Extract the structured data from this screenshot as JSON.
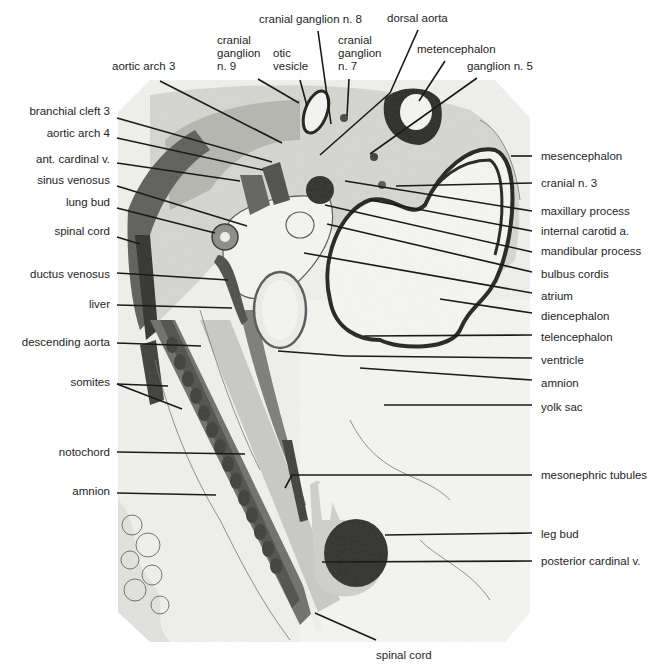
{
  "figure": {
    "type": "labeled micrograph",
    "colors": {
      "background": "#ffffff",
      "tissue_light": "#ececea",
      "tissue_mid": "#8a8a86",
      "tissue_dark": "#2a2a28",
      "leader_line": "#1a1a1a"
    }
  },
  "labels": {
    "top": [
      {
        "id": "aortic-arch-3",
        "text": "aortic arch 3"
      },
      {
        "id": "cranial-ganglion-9",
        "text": "cranial\nganglion\nn. 9"
      },
      {
        "id": "otic-vesicle",
        "text": "otic\nvesicle"
      },
      {
        "id": "cranial-ganglion-8",
        "text": "cranial ganglion n. 8"
      },
      {
        "id": "cranial-ganglion-7",
        "text": "cranial\nganglion\nn. 7"
      },
      {
        "id": "dorsal-aorta",
        "text": "dorsal aorta"
      },
      {
        "id": "metencephalon",
        "text": "metencephalon"
      },
      {
        "id": "ganglion-5",
        "text": "ganglion n. 5"
      }
    ],
    "left": [
      {
        "id": "branchial-cleft-3",
        "text": "branchial cleft 3"
      },
      {
        "id": "aortic-arch-4",
        "text": "aortic arch 4"
      },
      {
        "id": "ant-cardinal-v",
        "text": "ant. cardinal v."
      },
      {
        "id": "sinus-venosus",
        "text": "sinus venosus"
      },
      {
        "id": "lung-bud",
        "text": "lung bud"
      },
      {
        "id": "spinal-cord-upper",
        "text": "spinal cord"
      },
      {
        "id": "ductus-venosus",
        "text": "ductus venosus"
      },
      {
        "id": "liver",
        "text": "liver"
      },
      {
        "id": "descending-aorta",
        "text": "descending aorta"
      },
      {
        "id": "somites",
        "text": "somites"
      },
      {
        "id": "notochord",
        "text": "notochord"
      },
      {
        "id": "amnion-left",
        "text": "amnion"
      }
    ],
    "right": [
      {
        "id": "mesencephalon",
        "text": "mesencephalon"
      },
      {
        "id": "cranial-n-3",
        "text": "cranial n. 3"
      },
      {
        "id": "maxillary-process",
        "text": "maxillary process"
      },
      {
        "id": "internal-carotid-a",
        "text": "internal carotid a."
      },
      {
        "id": "mandibular-process",
        "text": "mandibular process"
      },
      {
        "id": "bulbus-cordis",
        "text": "bulbus cordis"
      },
      {
        "id": "atrium",
        "text": "atrium"
      },
      {
        "id": "diencephalon",
        "text": "diencephalon"
      },
      {
        "id": "telencephalon",
        "text": "telencephalon"
      },
      {
        "id": "ventricle",
        "text": "ventricle"
      },
      {
        "id": "amnion-right",
        "text": "amnion"
      },
      {
        "id": "yolk-sac",
        "text": "yolk sac"
      },
      {
        "id": "mesonephric-tubules",
        "text": "mesonephric tubules"
      },
      {
        "id": "leg-bud",
        "text": "leg bud"
      },
      {
        "id": "posterior-cardinal-v",
        "text": "posterior cardinal v."
      }
    ],
    "bottom": [
      {
        "id": "spinal-cord-lower",
        "text": "spinal cord"
      }
    ]
  }
}
